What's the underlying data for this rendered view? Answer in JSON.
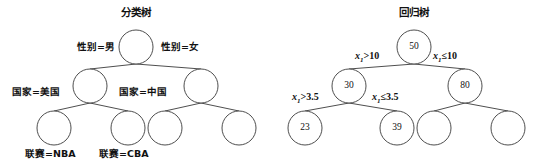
{
  "figure": {
    "background_color": "#ffffff",
    "stroke_color": "#3a3a3a",
    "text_color": "#111111"
  },
  "trees": [
    {
      "id": "classification-tree",
      "title": "分类树",
      "nodes": [
        {
          "id": "c-root",
          "value": "",
          "cx": 136,
          "cy": 47,
          "r": 17
        },
        {
          "id": "c-l1",
          "value": "",
          "cx": 90,
          "cy": 86,
          "r": 17
        },
        {
          "id": "c-r1",
          "value": "",
          "cx": 201,
          "cy": 86,
          "r": 17
        },
        {
          "id": "c-l2a",
          "value": "",
          "cx": 54,
          "cy": 128,
          "r": 17
        },
        {
          "id": "c-l2b",
          "value": "",
          "cx": 128,
          "cy": 128,
          "r": 17
        },
        {
          "id": "c-r2a",
          "value": "",
          "cx": 165,
          "cy": 128,
          "r": 17
        },
        {
          "id": "c-r2b",
          "value": "",
          "cx": 239,
          "cy": 128,
          "r": 17
        }
      ],
      "edge_labels": [
        {
          "id": "c-edge-gender-male",
          "text": "性别=男",
          "x": 77,
          "y": 41
        },
        {
          "id": "c-edge-gender-female",
          "text": "性别=女",
          "x": 161,
          "y": 41
        },
        {
          "id": "c-edge-country-usa",
          "text": "国家=美国",
          "x": 12,
          "y": 86
        },
        {
          "id": "c-edge-country-china",
          "text": "国家=中国",
          "x": 119,
          "y": 86
        }
      ],
      "leaf_labels": [
        {
          "id": "c-leaf-nba",
          "text": "联赛=NBA",
          "x": 25,
          "y": 148
        },
        {
          "id": "c-leaf-cba",
          "text": "联赛=CBA",
          "x": 99,
          "y": 148
        }
      ]
    },
    {
      "id": "regression-tree",
      "title": "回归树",
      "nodes": [
        {
          "id": "r-root",
          "value": "50",
          "cx": 144,
          "cy": 47,
          "r": 17
        },
        {
          "id": "r-l1",
          "value": "30",
          "cx": 79,
          "cy": 86,
          "r": 17
        },
        {
          "id": "r-r1",
          "value": "80",
          "cx": 195,
          "cy": 86,
          "r": 17
        },
        {
          "id": "r-l2a",
          "value": "23",
          "cx": 35,
          "cy": 128,
          "r": 17
        },
        {
          "id": "r-l2b",
          "value": "39",
          "cx": 127,
          "cy": 128,
          "r": 17
        },
        {
          "id": "r-r2a",
          "value": "",
          "cx": 164,
          "cy": 128,
          "r": 17
        },
        {
          "id": "r-r2b",
          "value": "",
          "cx": 238,
          "cy": 128,
          "r": 17
        }
      ],
      "edge_labels": [
        {
          "id": "r-edge-x1-gt-10",
          "var": "x",
          "sub": "1",
          "op": ">",
          "num": "10",
          "x": 85,
          "y": 50
        },
        {
          "id": "r-edge-x1-le-10",
          "var": "x",
          "sub": "1",
          "op": "≤",
          "num": "10",
          "x": 163,
          "y": 50
        },
        {
          "id": "r-edge-x1-gt-35",
          "var": "x",
          "sub": "1",
          "op": ">",
          "num": "3.5",
          "x": 22,
          "y": 91
        },
        {
          "id": "r-edge-x1-le-35",
          "var": "x",
          "sub": "1",
          "op": "≤",
          "num": "3.5",
          "x": 102,
          "y": 91
        }
      ],
      "leaf_labels": []
    }
  ]
}
